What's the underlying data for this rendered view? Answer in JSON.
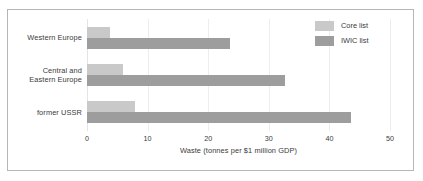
{
  "chart_data": {
    "type": "bar",
    "orientation": "horizontal",
    "title": "",
    "xlabel": "Waste (tonnes per $1 million GDP)",
    "ylabel": "",
    "xlim": [
      0,
      50
    ],
    "xticks": [
      "0",
      "10",
      "20",
      "30",
      "40",
      "50"
    ],
    "xtick_values": [
      0,
      10,
      20,
      30,
      40,
      50
    ],
    "grid": true,
    "legend_position": "top-right",
    "categories": [
      "Western Europe",
      "Central and\nEastern Europe",
      "former USSR"
    ],
    "category_lines": [
      [
        "Western Europe"
      ],
      [
        "Central and",
        "Eastern Europe"
      ],
      [
        "former USSR"
      ]
    ],
    "series": [
      {
        "name": "Core list",
        "color": "#c9c9c9",
        "values": [
          3.8,
          5.9,
          7.9
        ]
      },
      {
        "name": "IWIC list",
        "color": "#9d9d9d",
        "values": [
          23.6,
          32.7,
          43.6
        ]
      }
    ]
  },
  "legend": {
    "items": [
      {
        "label": "Core list"
      },
      {
        "label": "IWIC list"
      }
    ]
  },
  "axis": {
    "x_title": "Waste (tonnes per $1 million GDP)",
    "tick_labels": [
      "0",
      "10",
      "20",
      "30",
      "40",
      "50"
    ]
  },
  "colors": {
    "core": "#c9c9c9",
    "iwic": "#9d9d9d",
    "frame": "#b6b6b6",
    "gridline": "#ededed",
    "text": "#3a3a3a",
    "background": "#ffffff"
  }
}
